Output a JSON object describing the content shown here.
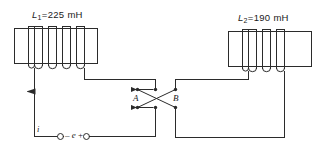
{
  "diagram": {
    "stroke_color": "#2b2b2b",
    "background_color": "#ffffff",
    "inductor_left": {
      "name": "L1",
      "label_symbol": "L",
      "label_subscript": "1",
      "label_equals": "=",
      "value": "225",
      "unit": "mH",
      "label_full": "L1=225 mH",
      "turns": 5
    },
    "inductor_right": {
      "name": "L2",
      "label_symbol": "L",
      "label_subscript": "2",
      "label_equals": "=",
      "value": "190",
      "unit": "mH",
      "label_full": "L2=190 mH",
      "turns": 4
    },
    "switch": {
      "type": "crossover",
      "contact_a_label": "A",
      "contact_b_label": "B",
      "contacts": 4
    },
    "source": {
      "minus_sign": "–",
      "symbol": "e",
      "plus_sign": "+",
      "label_full": "– e +"
    },
    "current": {
      "label": "i",
      "direction": "up"
    }
  }
}
